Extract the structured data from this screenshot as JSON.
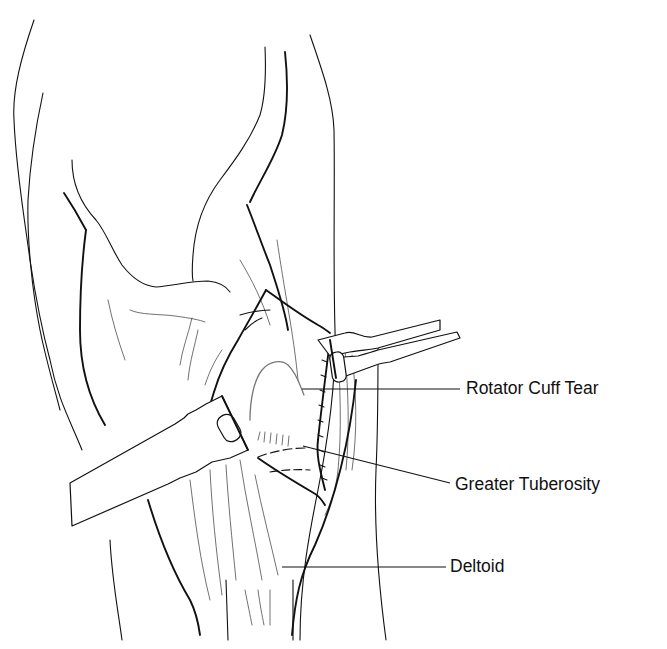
{
  "figure": {
    "labels": [
      {
        "id": "rotator-cuff-tear",
        "text": "Rotator Cuff Tear"
      },
      {
        "id": "greater-tuberosity",
        "text": "Greater Tuberosity"
      },
      {
        "id": "deltoid",
        "text": "Deltoid"
      }
    ]
  },
  "colors": {
    "line": "#111111",
    "background": "#ffffff"
  }
}
